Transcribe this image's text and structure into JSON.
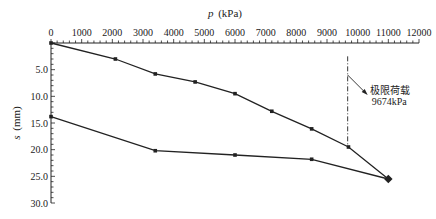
{
  "chart_data": {
    "type": "line",
    "title": "",
    "xlabel": "p (kPa)",
    "xlabel_italic": "p",
    "xlabel_unit": "(kPa)",
    "ylabel": "s (mm)",
    "ylabel_italic": "s",
    "ylabel_unit": "(mm)",
    "x_axis_position": "top",
    "y_axis_inverted": true,
    "xlim": [
      0,
      12000
    ],
    "ylim": [
      0,
      30.0
    ],
    "x_ticks": [
      0,
      1000,
      2000,
      3000,
      4000,
      5000,
      6000,
      7000,
      8000,
      9000,
      10000,
      11000,
      12000
    ],
    "x_tick_labels": [
      "0",
      "1000",
      "2000",
      "3000",
      "4000",
      "5000",
      "6000",
      "7000",
      "8000",
      "9000",
      "10000",
      "11000",
      "12000"
    ],
    "y_ticks": [
      5.0,
      10.0,
      15.0,
      20.0,
      25.0,
      30.0
    ],
    "y_tick_labels": [
      "5.0",
      "10.0",
      "15.0",
      "20.0",
      "25.0",
      "30.0"
    ],
    "grid": false,
    "legend": null,
    "series": [
      {
        "name": "loading",
        "x": [
          0,
          2100,
          3400,
          4700,
          6000,
          7200,
          8500,
          9700,
          11000
        ],
        "y": [
          0,
          3.0,
          5.8,
          7.3,
          9.5,
          12.8,
          16.1,
          19.5,
          25.5
        ]
      },
      {
        "name": "unloading",
        "x": [
          11000,
          8500,
          6000,
          3400,
          0
        ],
        "y": [
          25.5,
          21.8,
          21.0,
          20.2,
          13.8
        ]
      }
    ],
    "annotations": [
      {
        "type": "vline",
        "x": 9674,
        "style": "dash-dot",
        "y_range": [
          2.5,
          19.5
        ]
      },
      {
        "type": "text",
        "line1": "极限荷载",
        "line2": "9674kPa",
        "arrow_from_x": 9674,
        "arrow_from_y": 6.0
      }
    ]
  }
}
